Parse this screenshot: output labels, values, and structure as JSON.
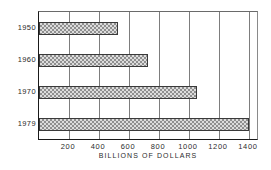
{
  "chart_data": {
    "type": "bar",
    "orientation": "horizontal",
    "title": "",
    "xlabel": "BILLIONS OF DOLLARS",
    "ylabel": "",
    "categories": [
      "1950",
      "1960",
      "1970",
      "1979"
    ],
    "values": [
      530,
      725,
      1055,
      1400
    ],
    "xlim": [
      0,
      1467
    ],
    "xticks": [
      200,
      400,
      600,
      800,
      1000,
      1200,
      1400
    ],
    "xticklabels": [
      "200",
      "400",
      "600",
      "800",
      "1000",
      "1200",
      "1400"
    ],
    "grid": "vertical",
    "legend": "none",
    "series": [
      {
        "name": "",
        "values": [
          530,
          725,
          1055,
          1400
        ]
      }
    ],
    "bar_fill": "checkered-hatch",
    "bar_edge_color": "#3a3a3a",
    "axis_color": "#1a1a1a",
    "grid_color": "#7d7d7d"
  }
}
